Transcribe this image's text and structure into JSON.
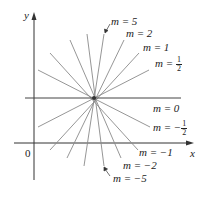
{
  "diagram": {
    "axes": {
      "x_label": "x",
      "y_label": "y",
      "origin_label": "0"
    },
    "center": {
      "x": 94,
      "y": 98
    },
    "line_color": "#8a8a8a",
    "axis_color": "#333333",
    "labels": [
      {
        "name": "m-5",
        "text": "m = 5"
      },
      {
        "name": "m-2",
        "text": "m = 2"
      },
      {
        "name": "m-1",
        "text": "m = 1"
      },
      {
        "name": "m-half",
        "prefix": "m = ",
        "num": "1",
        "den": "2"
      },
      {
        "name": "m-0",
        "text": "m = 0"
      },
      {
        "name": "m-neg-half",
        "prefix": "m = −",
        "num": "1",
        "den": "2"
      },
      {
        "name": "m-neg-1",
        "text": "m = −1"
      },
      {
        "name": "m-neg-2",
        "text": "m = −2"
      },
      {
        "name": "m-neg-5",
        "text": "m = −5"
      }
    ],
    "slopes": [
      "5",
      "2",
      "1",
      "1/2",
      "0",
      "-1/2",
      "-1",
      "-2",
      "-5"
    ]
  }
}
